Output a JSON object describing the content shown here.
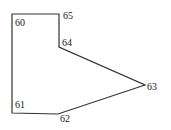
{
  "diagram": {
    "type": "polygon",
    "stroke_color": "#333333",
    "vertices": [
      {
        "id": "60",
        "label": "60",
        "x": 12,
        "y": 14,
        "lx": 15,
        "ly": 26
      },
      {
        "id": "65",
        "label": "65",
        "x": 59,
        "y": 14,
        "lx": 63,
        "ly": 19
      },
      {
        "id": "64",
        "label": "64",
        "x": 59,
        "y": 47,
        "lx": 62,
        "ly": 46
      },
      {
        "id": "63",
        "label": "63",
        "x": 145,
        "y": 85,
        "lx": 147,
        "ly": 90
      },
      {
        "id": "62",
        "label": "62",
        "x": 58,
        "y": 114,
        "lx": 60,
        "ly": 122
      },
      {
        "id": "61",
        "label": "61",
        "x": 12,
        "y": 113,
        "lx": 15,
        "ly": 108
      }
    ]
  }
}
